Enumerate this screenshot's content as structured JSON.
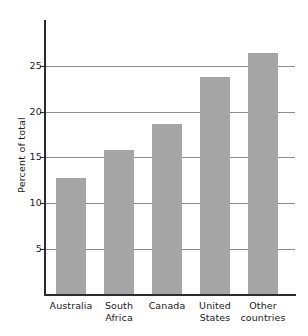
{
  "chart_data": {
    "type": "bar",
    "title": "",
    "xlabel": "",
    "ylabel": "Percent of total",
    "categories": [
      "Australia",
      "South Africa",
      "Canada",
      "United States",
      "Other countries"
    ],
    "category_lines": [
      [
        "Australia"
      ],
      [
        "South",
        "Africa"
      ],
      [
        "Canada"
      ],
      [
        "United",
        "States"
      ],
      [
        "Other",
        "countries"
      ]
    ],
    "values": [
      12.8,
      15.8,
      18.7,
      23.8,
      26.5
    ],
    "ylim": [
      0,
      29
    ],
    "yticks": [
      5,
      10,
      15,
      20,
      25
    ],
    "ytick_labels": [
      "5",
      "10",
      "15",
      "20",
      "25"
    ],
    "grid": true,
    "grid_axis": "y",
    "legend": "none",
    "bar_color": "#a5a5a5",
    "axis_color": "#2b2b2b",
    "grid_color": "#8d8d8d",
    "background": "#ffffff"
  }
}
